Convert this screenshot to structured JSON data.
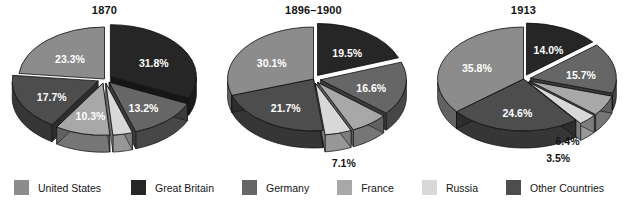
{
  "figure": {
    "title": "",
    "background": "#ffffff"
  },
  "legend": {
    "position": "bottom",
    "items": [
      {
        "label": "United States",
        "color": "#8c8c8c",
        "side": "#6e6e6e"
      },
      {
        "label": "Great Britain",
        "color": "#262626",
        "side": "#111111"
      },
      {
        "label": "Germany",
        "color": "#666666",
        "side": "#4a4a4a"
      },
      {
        "label": "France",
        "color": "#a8a8a8",
        "side": "#888888"
      },
      {
        "label": "Russia",
        "color": "#d8d8d8",
        "side": "#b4b4b4"
      },
      {
        "label": "Other Countries",
        "color": "#4d4d4d",
        "side": "#343434"
      }
    ]
  },
  "chart_data": [
    {
      "type": "pie",
      "title": "1870",
      "xlabel": "",
      "ylabel": "",
      "categories": [
        "Great Britain",
        "Germany",
        "Russia",
        "France",
        "Other Countries",
        "United States"
      ],
      "values": [
        31.8,
        13.2,
        3.7,
        10.3,
        17.7,
        23.3
      ],
      "labels": [
        "31.8%",
        "13.2%",
        "3.7%",
        "10.3%",
        "17.7%",
        "23.3%"
      ],
      "label_colors": [
        "white",
        "white",
        "dark",
        "white",
        "white",
        "white"
      ],
      "colors": [
        "#262626",
        "#666666",
        "#d8d8d8",
        "#a8a8a8",
        "#4d4d4d",
        "#8c8c8c"
      ],
      "exploded": [
        true,
        true,
        true,
        true,
        true,
        false
      ],
      "legend_position": "bottom",
      "grid": false
    },
    {
      "type": "pie",
      "title": "1896–1900",
      "xlabel": "",
      "ylabel": "",
      "categories": [
        "Great Britain",
        "Germany",
        "France",
        "Russia",
        "Other Countries",
        "United States"
      ],
      "values": [
        19.5,
        16.6,
        7.1,
        5.0,
        21.7,
        30.1
      ],
      "labels": [
        "19.5%",
        "16.6%",
        "7.1%",
        "5.0%",
        "21.7%",
        "30.1%"
      ],
      "label_colors": [
        "white",
        "white",
        "dark",
        "dark",
        "white",
        "white"
      ],
      "colors": [
        "#262626",
        "#666666",
        "#a8a8a8",
        "#d8d8d8",
        "#4d4d4d",
        "#8c8c8c"
      ],
      "exploded": [
        true,
        true,
        true,
        true,
        false,
        false
      ],
      "legend_position": "bottom",
      "grid": false
    },
    {
      "type": "pie",
      "title": "1913",
      "xlabel": "",
      "ylabel": "",
      "categories": [
        "Great Britain",
        "Germany",
        "France",
        "Russia",
        "Other Countries",
        "United States"
      ],
      "values": [
        14.0,
        15.7,
        6.4,
        3.5,
        24.6,
        35.8
      ],
      "labels": [
        "14.0%",
        "15.7%",
        "6.4%",
        "3.5%",
        "24.6%",
        "35.8%"
      ],
      "label_colors": [
        "white",
        "white",
        "dark",
        "dark",
        "white",
        "white"
      ],
      "colors": [
        "#262626",
        "#666666",
        "#a8a8a8",
        "#d8d8d8",
        "#4d4d4d",
        "#8c8c8c"
      ],
      "exploded": [
        true,
        true,
        true,
        true,
        false,
        false
      ],
      "legend_position": "bottom",
      "grid": false
    }
  ]
}
